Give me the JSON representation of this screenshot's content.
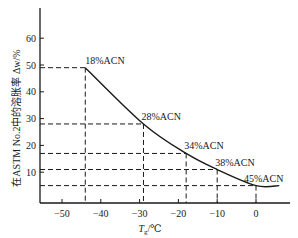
{
  "chart_data": {
    "type": "line",
    "title": "",
    "xlabel": "T_g/℃",
    "ylabel": "在ASTM No.2中的溶胀率 Δw/%",
    "xlim": [
      -57,
      8
    ],
    "ylim": [
      0,
      70
    ],
    "grid": false,
    "legend": null,
    "x_ticks": [
      -50,
      -40,
      -30,
      -20,
      -10,
      0
    ],
    "x_tick_labels": [
      "−50",
      "−40",
      "−30",
      "−20",
      "−10",
      "0"
    ],
    "y_ticks": [
      10,
      20,
      30,
      40,
      50,
      60
    ],
    "y_tick_labels": [
      "10",
      "20",
      "30",
      "40",
      "50",
      "60"
    ],
    "series": [
      {
        "name": "ACN content",
        "x": [
          -44,
          -29,
          -18,
          -10,
          0
        ],
        "y": [
          49,
          28,
          17,
          11,
          5
        ],
        "labels": [
          "18%ACN",
          "28%ACN",
          "34%ACN",
          "38%ACN",
          "45%ACN"
        ]
      }
    ],
    "annotations": [
      "Dashed reference lines drop from each labeled point to both axes"
    ]
  },
  "axes": {
    "xlabel_main": "T",
    "xlabel_sub": "g",
    "xlabel_unit": "/℃",
    "ylabel": "在ASTM No.2中的溶胀率 Δw/%"
  },
  "colors": {
    "line": "#1a1a1a",
    "background": "#ffffff"
  }
}
